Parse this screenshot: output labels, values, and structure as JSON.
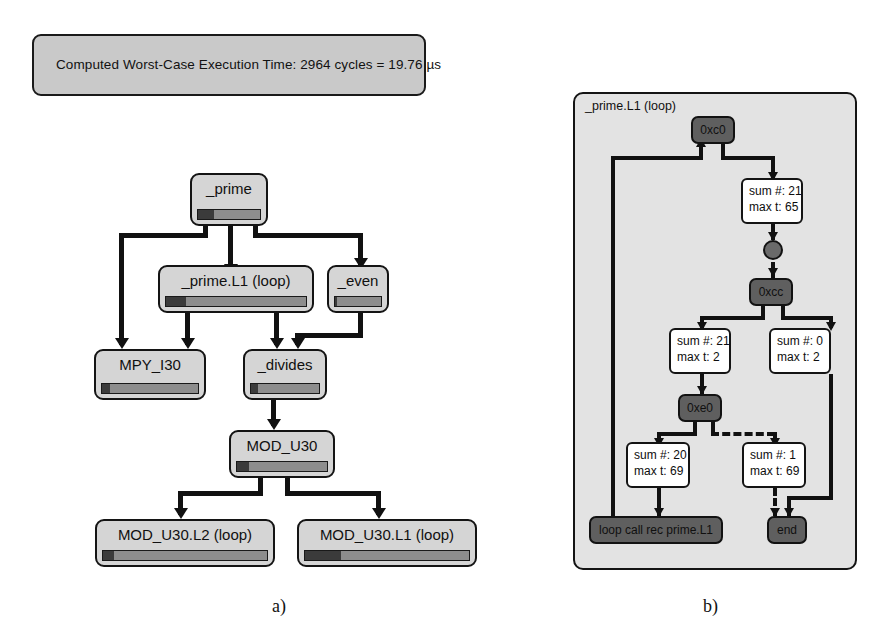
{
  "figure": {
    "banner": {
      "text": "Computed Worst-Case Execution Time: 2964 cycles = 19.76 µs"
    },
    "captions": {
      "left": "a)",
      "right": "b)"
    },
    "colors": {
      "node_fill": "#d5d5d5",
      "node_border": "#141414",
      "bar_track": "#8d8d8d",
      "bar_fill": "#3b3b3b",
      "panel_fill": "#e3e3e3",
      "dark_node": "#5f5f5f",
      "banner_fill": "#c9c9c9",
      "edge": "#111111",
      "white_box": "#ffffff"
    }
  },
  "call_graph": {
    "title": "Call graph with worst-case execution coverage bars",
    "nodes": [
      {
        "id": "prime",
        "label": "_prime",
        "bar_percent": 26
      },
      {
        "id": "prime_l1",
        "label": "_prime.L1 (loop)",
        "bar_percent": 14
      },
      {
        "id": "even",
        "label": "_even",
        "bar_percent": 5
      },
      {
        "id": "mpy_i30",
        "label": "MPY_I30",
        "bar_percent": 8
      },
      {
        "id": "divides",
        "label": "_divides",
        "bar_percent": 10
      },
      {
        "id": "mod_u30",
        "label": "MOD_U30",
        "bar_percent": 13
      },
      {
        "id": "mod_u30_l2",
        "label": "MOD_U30.L2 (loop)",
        "bar_percent": 7
      },
      {
        "id": "mod_u30_l1",
        "label": "MOD_U30.L1 (loop)",
        "bar_percent": 22
      }
    ],
    "edges": [
      {
        "from": "prime",
        "to": "mpy_i30"
      },
      {
        "from": "prime",
        "to": "prime_l1"
      },
      {
        "from": "prime",
        "to": "even"
      },
      {
        "from": "prime_l1",
        "to": "mpy_i30"
      },
      {
        "from": "prime_l1",
        "to": "divides"
      },
      {
        "from": "even",
        "to": "divides"
      },
      {
        "from": "divides",
        "to": "mod_u30"
      },
      {
        "from": "mod_u30",
        "to": "mod_u30_l2"
      },
      {
        "from": "mod_u30",
        "to": "mod_u30_l1"
      }
    ]
  },
  "flow_graph": {
    "title": "_prime.L1 (loop)",
    "nodes": [
      {
        "id": "n_0xc0",
        "label": "0xc0",
        "kind": "basic-block"
      },
      {
        "id": "n_0xcc",
        "label": "0xcc",
        "kind": "basic-block"
      },
      {
        "id": "n_0xe0",
        "label": "0xe0",
        "kind": "basic-block"
      },
      {
        "id": "n_loop",
        "label": "loop call rec prime.L1",
        "kind": "terminal"
      },
      {
        "id": "n_end",
        "label": "end",
        "kind": "terminal"
      },
      {
        "id": "n_join",
        "label": "",
        "kind": "junction"
      }
    ],
    "annotations": [
      {
        "id": "a1",
        "sum_label": "sum #: 21",
        "max_label": "max t: 65",
        "sum": 21,
        "max_t": 65
      },
      {
        "id": "a2",
        "sum_label": "sum #: 21",
        "max_label": "max t: 2",
        "sum": 21,
        "max_t": 2
      },
      {
        "id": "a3",
        "sum_label": "sum #: 0",
        "max_label": "max t: 2",
        "sum": 0,
        "max_t": 2
      },
      {
        "id": "a4",
        "sum_label": "sum #: 20",
        "max_label": "max t: 69",
        "sum": 20,
        "max_t": 69
      },
      {
        "id": "a5",
        "sum_label": "sum #: 1",
        "max_label": "max t: 69",
        "sum": 1,
        "max_t": 69
      }
    ],
    "edges": [
      {
        "from": "n_0xc0",
        "to": "a1",
        "style": "solid"
      },
      {
        "from": "a1",
        "to": "n_join",
        "style": "solid"
      },
      {
        "from": "n_join",
        "to": "n_0xcc",
        "style": "solid"
      },
      {
        "from": "n_0xcc",
        "to": "a2",
        "style": "solid"
      },
      {
        "from": "n_0xcc",
        "to": "a3",
        "style": "solid"
      },
      {
        "from": "a2",
        "to": "n_0xe0",
        "style": "solid"
      },
      {
        "from": "n_0xe0",
        "to": "a4",
        "style": "solid"
      },
      {
        "from": "n_0xe0",
        "to": "a5",
        "style": "dashed"
      },
      {
        "from": "a4",
        "to": "n_loop",
        "style": "solid"
      },
      {
        "from": "a5",
        "to": "n_end",
        "style": "dashed"
      },
      {
        "from": "a3",
        "to": "n_end",
        "style": "solid"
      },
      {
        "from": "n_loop",
        "to": "n_0xc0",
        "style": "solid"
      }
    ]
  }
}
